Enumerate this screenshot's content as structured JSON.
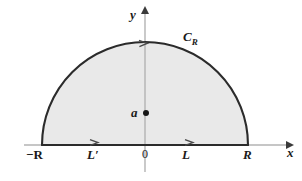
{
  "figure": {
    "kind": "complex-contour-diagram",
    "colors": {
      "fill": "#e9e9e9",
      "contour_stroke": "#2b2b2b",
      "axis_stroke": "#b0b0b0",
      "text": "#1a1a1a",
      "background": "#ffffff"
    },
    "labels": {
      "y_axis": "y",
      "x_axis": "x",
      "origin": "0",
      "left_endpoint": "−R",
      "right_endpoint": "R",
      "left_segment": "L′",
      "right_segment": "L",
      "pole": "a",
      "arc": "C",
      "arc_subscript": "R"
    },
    "geometry": {
      "center_x": 145,
      "baseline_y": 145,
      "radius": 103,
      "arc_apex_y": 42,
      "pole_x": 145,
      "pole_y": 113,
      "pole_dot_radius": 3,
      "x_axis_start": 24,
      "x_axis_end": 292,
      "y_axis_top": 11,
      "y_axis_bottom": 172
    },
    "direction_markers": [
      {
        "name": "arc-direction-arrow",
        "x": 146,
        "y": 43,
        "points": "left"
      },
      {
        "name": "left-segment-direction-arrow",
        "x": 96,
        "y": 143,
        "points": "right"
      },
      {
        "name": "right-segment-direction-arrow",
        "x": 191,
        "y": 143,
        "points": "right"
      }
    ]
  }
}
